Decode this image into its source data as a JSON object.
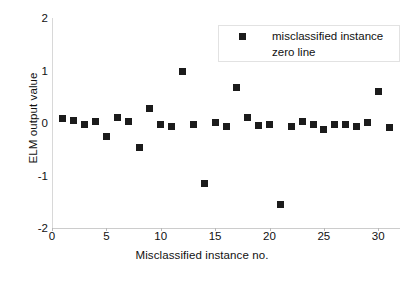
{
  "chart_data": {
    "type": "scatter",
    "title": "",
    "xlabel": "Misclassified instance no.",
    "ylabel": "ELM output value",
    "xlim": [
      0,
      32
    ],
    "ylim": [
      -2,
      2
    ],
    "xticks": [
      0,
      5,
      10,
      15,
      20,
      25,
      30
    ],
    "xticklabels": [
      "0",
      "5",
      "10",
      "15",
      "20",
      "25",
      "30"
    ],
    "yticks": [
      2,
      1,
      0,
      -1,
      -2
    ],
    "yticklabels": [
      "2",
      "1",
      "0",
      "-1",
      "-2"
    ],
    "grid": false,
    "legend_position": "upper right",
    "legend": [
      {
        "label": "misclassified instance",
        "marker": "square",
        "color": "#1b1b1b"
      },
      {
        "label": "zero line",
        "marker": "line",
        "color": "#1b1b1b"
      }
    ],
    "series": [
      {
        "name": "misclassified instance",
        "marker": "square",
        "color": "#1b1b1b",
        "x": [
          1,
          2,
          3,
          4,
          5,
          6,
          7,
          8,
          9,
          10,
          11,
          12,
          13,
          14,
          15,
          16,
          17,
          18,
          19,
          20,
          21,
          22,
          23,
          24,
          25,
          26,
          27,
          28,
          29,
          30,
          31
        ],
        "y": [
          0.08,
          0.05,
          -0.03,
          0.02,
          -0.25,
          0.1,
          0.03,
          -0.47,
          0.28,
          -0.02,
          -0.06,
          0.98,
          -0.02,
          -1.15,
          0.01,
          -0.06,
          0.67,
          0.11,
          -0.05,
          -0.02,
          -1.55,
          -0.06,
          0.02,
          -0.02,
          -0.12,
          -0.02,
          -0.03,
          -0.07,
          0.01,
          0.6,
          -0.09
        ]
      }
    ],
    "zero_line": {
      "y": 0,
      "color": "#1b1b1b",
      "visible": false
    }
  },
  "axis": {
    "y_title": "ELM output value",
    "x_title": "Misclassified instance no."
  }
}
